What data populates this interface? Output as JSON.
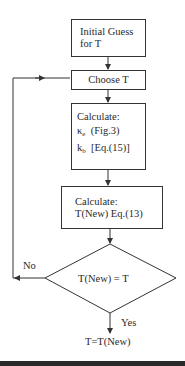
{
  "flowchart": {
    "steps": [
      {
        "id": "initial-guess",
        "lines": [
          "Initial Guess",
          "for T"
        ]
      },
      {
        "id": "choose-t",
        "lines": [
          "Choose T"
        ]
      },
      {
        "id": "calc-kappa",
        "lines": [
          "Calculate:"
        ],
        "items": [
          {
            "symbol": "κ",
            "sub": "e",
            "ref": "(Fig.3)"
          },
          {
            "symbol": "k",
            "sub": "b",
            "ref": "[Eq.(15)]"
          }
        ]
      },
      {
        "id": "calc-tnew",
        "lines": [
          "Calculate:",
          "T(New) Eq.(13)"
        ]
      }
    ],
    "decision": {
      "label": "T(New) = T",
      "no_label": "No",
      "yes_label": "Yes"
    },
    "result": "T=T(New)"
  },
  "colors": {
    "line": "#333333",
    "bar": "#2b2b2b"
  }
}
